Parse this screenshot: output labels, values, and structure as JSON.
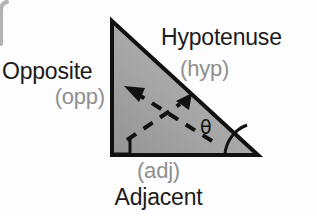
{
  "diagram": {
    "background_color": "#fdfdfd",
    "triangle": {
      "fill_light": "#a9a9a9",
      "fill_dark": "#8d8d8d",
      "stroke_color": "#111111",
      "vertices": {
        "top": [
          112,
          21
        ],
        "bottom_left": [
          112,
          155
        ],
        "bottom_right": [
          258,
          155
        ]
      }
    },
    "labels": {
      "opposite": "Opposite",
      "opposite_short": "(opp)",
      "hypotenuse": "Hypotenuse",
      "hypotenuse_short": "(hyp)",
      "adjacent": "Adjacent",
      "adjacent_short": "(adj)",
      "theta": "θ"
    },
    "colors": {
      "label_main": "#1b1b1b",
      "label_sub": "#8f8f8f",
      "ink": "#111111",
      "edge_artifact": "#9a9a9a"
    },
    "markers": {
      "right_angle": "right-angle-square",
      "angle_arc": "theta-angle-arc",
      "dashed_arrow_left": "dashed-arrow-up-left",
      "dashed_arrow_right": "dashed-arrow-up-right"
    }
  }
}
